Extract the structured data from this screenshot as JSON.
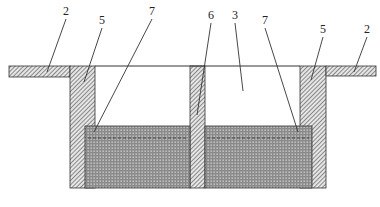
{
  "diagram": {
    "type": "cross-section schematic",
    "colors": {
      "background": "#ffffff",
      "line": "#333333",
      "hatch_bg": "#e6e6e6",
      "hatch_line": "#555555",
      "fill_bg": "#8a8a8a",
      "fill_dot": "#d8d8d8",
      "dashed": "#333333"
    },
    "labels": [
      {
        "id": "left-flange-label",
        "text": "2",
        "x": 66,
        "y": 15,
        "target": [
          47,
          72
        ]
      },
      {
        "id": "left-wall-label",
        "text": "5",
        "x": 102,
        "y": 24,
        "target": [
          84,
          82
        ]
      },
      {
        "id": "left-marker-label",
        "text": "7",
        "x": 152,
        "y": 15,
        "target": [
          94,
          132
        ]
      },
      {
        "id": "center-wall-label",
        "text": "6",
        "x": 211,
        "y": 19,
        "target": [
          197,
          115
        ]
      },
      {
        "id": "chamber-label",
        "text": "3",
        "x": 235,
        "y": 19,
        "target": [
          243,
          91
        ]
      },
      {
        "id": "right-marker-label",
        "text": "7",
        "x": 265,
        "y": 24,
        "target": [
          298,
          132
        ]
      },
      {
        "id": "right-wall-label",
        "text": "5",
        "x": 323,
        "y": 33,
        "target": [
          311,
          80
        ]
      },
      {
        "id": "right-flange-label",
        "text": "2",
        "x": 367,
        "y": 33,
        "target": [
          354,
          72
        ]
      }
    ],
    "parts": {
      "left_flange": {
        "x": 9,
        "y": 66,
        "w": 61,
        "h": 11
      },
      "left_wall": {
        "x": 70,
        "y": 66,
        "w": 25,
        "h": 122
      },
      "center_wall": {
        "x": 190,
        "y": 66,
        "w": 15,
        "h": 122
      },
      "right_wall": {
        "x": 300,
        "y": 66,
        "w": 26,
        "h": 122
      },
      "right_flange": {
        "x": 326,
        "y": 66,
        "w": 50,
        "h": 10
      },
      "top_line": {
        "x1": 95,
        "x2": 300,
        "y": 66
      },
      "fill_left": {
        "x": 85,
        "y": 126,
        "w": 105,
        "h": 62
      },
      "fill_right": {
        "x": 205,
        "y": 126,
        "w": 107,
        "h": 62
      },
      "dashed_line_y": 138
    }
  }
}
